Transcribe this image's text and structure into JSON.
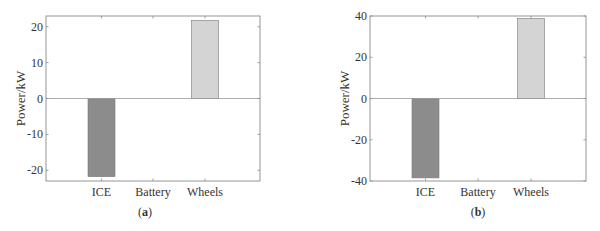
{
  "chart_data": [
    {
      "type": "bar",
      "panel_label": "(a)",
      "panel_letter": "a",
      "title": "",
      "xlabel": "",
      "ylabel": "Power/kW",
      "categories": [
        "ICE",
        "Battery",
        "Wheels"
      ],
      "values": [
        -21.8,
        0,
        21.8
      ],
      "bar_colors": [
        "#8c8c8c",
        "#b4b4b4",
        "#d4d4d4"
      ],
      "ylim": [
        -23,
        23
      ],
      "yticks": [
        -20,
        -10,
        0,
        10,
        20
      ],
      "ytick_labels": [
        "-20",
        "-10",
        "0",
        "10",
        "20"
      ],
      "grid": false,
      "zero_line": true
    },
    {
      "type": "bar",
      "panel_label": "(b)",
      "panel_letter": "b",
      "title": "",
      "xlabel": "",
      "ylabel": "Power/kW",
      "categories": [
        "ICE",
        "Battery",
        "Wheels"
      ],
      "values": [
        -38.5,
        0,
        38.8
      ],
      "bar_colors": [
        "#8c8c8c",
        "#b4b4b4",
        "#d4d4d4"
      ],
      "ylim": [
        -40,
        40
      ],
      "yticks": [
        -40,
        -20,
        0,
        20,
        40
      ],
      "ytick_labels": [
        "-40",
        "-20",
        "0",
        "20",
        "40"
      ],
      "grid": false,
      "zero_line": true
    }
  ],
  "layout": {
    "panels": [
      {
        "axes": {
          "left": 46,
          "right": 260,
          "top": 16,
          "bottom": 181
        },
        "bar_centers": [
          101.5,
          153,
          205
        ],
        "bar_width": 27,
        "label_x": 145
      },
      {
        "axes": {
          "left": 370,
          "right": 586,
          "top": 16,
          "bottom": 181
        },
        "bar_centers": [
          425.5,
          478,
          531
        ],
        "bar_width": 27,
        "label_x": 478
      }
    ]
  }
}
